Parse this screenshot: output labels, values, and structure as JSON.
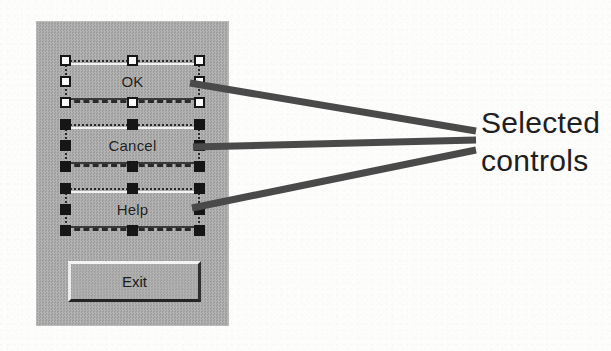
{
  "figure": {
    "caption_lines": [
      "Selected",
      "controls"
    ],
    "background_color": "#fdfdfc",
    "annotation_color": "#202020",
    "leader_line_color": "#4a4a4a",
    "leader_line_count": 3,
    "leader_convergence_point": {
      "x": 475,
      "y": 140
    }
  },
  "dialog": {
    "name": "dialog-panel",
    "panel_color": "#a8a8a8",
    "bounds": {
      "x": 37,
      "y": 22,
      "width": 191,
      "height": 303
    },
    "controls": [
      {
        "label": "OK",
        "selected": true,
        "handle_style": "hollow",
        "handle_fill": "#fbfbfb",
        "handle_border": "#161616",
        "handle_count": 8,
        "handles": [
          "top-left",
          "top-center",
          "top-right",
          "middle-left",
          "middle-right",
          "bottom-left",
          "bottom-center",
          "bottom-right"
        ]
      },
      {
        "label": "Cancel",
        "selected": true,
        "handle_style": "filled",
        "handle_fill": "#161616",
        "handle_border": "#161616",
        "handle_count": 8,
        "handles": [
          "top-left",
          "top-center",
          "top-right",
          "middle-left",
          "middle-right",
          "bottom-left",
          "bottom-center",
          "bottom-right"
        ]
      },
      {
        "label": "Help",
        "selected": true,
        "handle_style": "filled",
        "handle_fill": "#161616",
        "handle_border": "#161616",
        "handle_count": 8,
        "handles": [
          "top-left",
          "top-center",
          "top-right",
          "middle-left",
          "middle-right",
          "bottom-left",
          "bottom-center",
          "bottom-right"
        ]
      },
      {
        "label": "Exit",
        "selected": false,
        "handle_style": "none",
        "handle_count": 0,
        "handles": []
      }
    ]
  }
}
